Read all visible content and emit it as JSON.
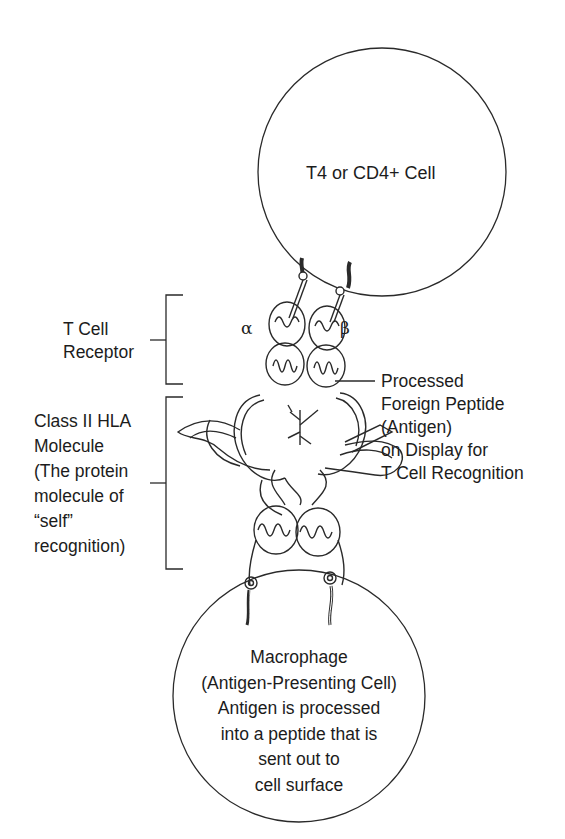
{
  "diagram": {
    "top_cell": {
      "label": "T4 or CD4+ Cell"
    },
    "bottom_cell": {
      "lines": [
        "Macrophage",
        "(Antigen-Presenting Cell)",
        "Antigen is processed",
        "into a peptide that is",
        "sent out to",
        "cell surface"
      ]
    },
    "tcr_label": {
      "lines": [
        "T Cell",
        "Receptor"
      ]
    },
    "hla_label": {
      "lines": [
        "Class II HLA",
        "Molecule",
        "(The protein",
        "molecule of",
        "“self”",
        "recognition)"
      ]
    },
    "peptide_label": {
      "lines": [
        "Processed",
        "Foreign Peptide",
        "(Antigen)",
        "on Display for",
        "T Cell Recognition"
      ]
    },
    "chain_labels": {
      "alpha": "α",
      "beta": "β"
    },
    "colors": {
      "line": "#2a2a2a",
      "background": "#ffffff"
    }
  }
}
